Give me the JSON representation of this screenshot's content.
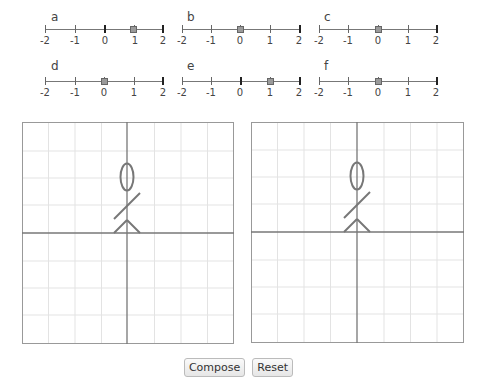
{
  "sliders": [
    {
      "name": "a",
      "value": 1,
      "min": -2,
      "max": 2,
      "ticks": [
        "-2",
        "-1",
        "0",
        "1",
        "2"
      ]
    },
    {
      "name": "b",
      "value": 0,
      "min": -2,
      "max": 2,
      "ticks": [
        "-2",
        "-1",
        "0",
        "1",
        "2"
      ]
    },
    {
      "name": "c",
      "value": 0,
      "min": -2,
      "max": 2,
      "ticks": [
        "-2",
        "-1",
        "0",
        "1",
        "2"
      ]
    },
    {
      "name": "d",
      "value": 0,
      "min": -2,
      "max": 2,
      "ticks": [
        "-2",
        "-1",
        "0",
        "1",
        "2"
      ]
    },
    {
      "name": "e",
      "value": 1,
      "min": -2,
      "max": 2,
      "ticks": [
        "-2",
        "-1",
        "0",
        "1",
        "2"
      ]
    },
    {
      "name": "f",
      "value": 0,
      "min": -2,
      "max": 2,
      "ticks": [
        "-2",
        "-1",
        "0",
        "1",
        "2"
      ]
    }
  ],
  "canvases": {
    "left": {
      "grid_cells": 8,
      "figure": "stick-figure"
    },
    "right": {
      "grid_cells": 8,
      "figure": "stick-figure"
    }
  },
  "colors": {
    "grid": "#e3e3e3",
    "axis": "#777777",
    "border": "#999999",
    "figure": "#777777"
  },
  "buttons": {
    "compose": "Compose",
    "reset": "Reset"
  }
}
